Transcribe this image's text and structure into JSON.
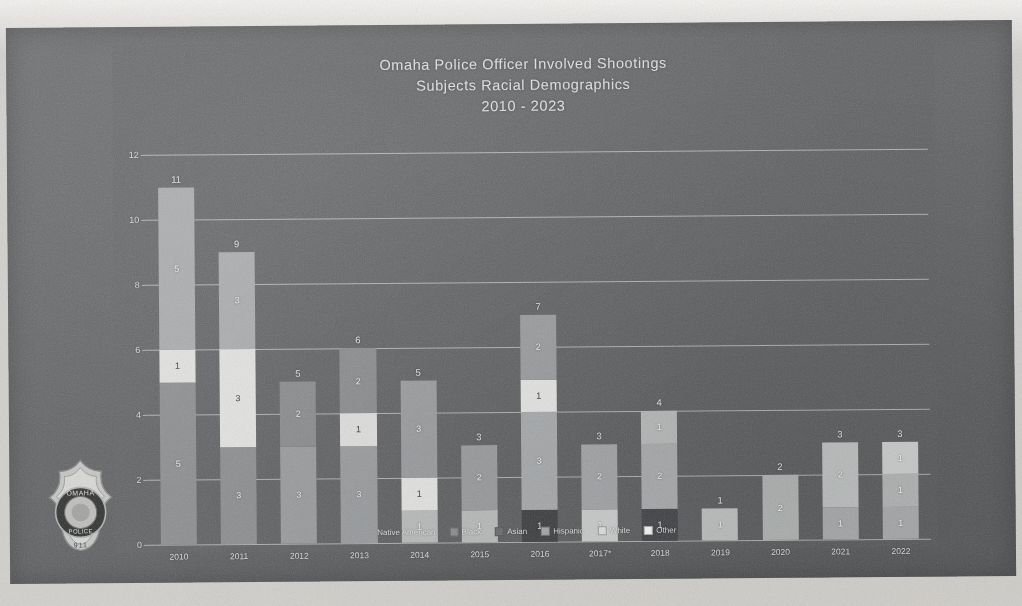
{
  "slide": {
    "title_lines": [
      "Omaha Police Officer Involved Shootings",
      "Subjects Racial Demographics",
      "2010 - 2023"
    ],
    "badge_alt": "omaha-police-badge"
  },
  "legend": {
    "position": "bottom-center",
    "entries": [
      {
        "label": "Native American",
        "color": "#3c3e40"
      },
      {
        "label": "Black",
        "color": "#8d8f91"
      },
      {
        "label": "Asian",
        "color": "#6d7073"
      },
      {
        "label": "Hispanic",
        "color": "#a7a9ab"
      },
      {
        "label": "White",
        "color": "#dcdddd"
      },
      {
        "label": "Other",
        "color": "#f2f2f0"
      }
    ]
  },
  "chart_data": {
    "type": "bar",
    "stacked": true,
    "title": "Omaha Police Officer Involved Shootings Subjects Racial Demographics 2010 - 2023",
    "xlabel": "",
    "ylabel": "",
    "ylim": [
      0,
      12
    ],
    "yticks": [
      0,
      2,
      4,
      6,
      8,
      10,
      12
    ],
    "grid": true,
    "categories": [
      "2010",
      "2011",
      "2012",
      "2013",
      "2014",
      "2015",
      "2016",
      "2017*",
      "2018",
      "2019",
      "2020",
      "2021",
      "2022"
    ],
    "series": [
      {
        "name": "Native American",
        "color": "#3c3e40",
        "values": [
          0,
          0,
          0,
          0,
          0,
          0,
          1,
          0,
          1,
          0,
          0,
          0,
          0
        ]
      },
      {
        "name": "Black",
        "color": "#8d8f91",
        "values": [
          5,
          3,
          3,
          3,
          1,
          1,
          3,
          0,
          0,
          0,
          0,
          1,
          1
        ]
      },
      {
        "name": "Asian",
        "color": "#6d7073",
        "values": [
          0,
          0,
          0,
          0,
          0,
          0,
          0,
          0,
          0,
          0,
          0,
          0,
          0
        ]
      },
      {
        "name": "Hispanic",
        "color": "#a7a9ab",
        "values": [
          5,
          3,
          2,
          2,
          3,
          2,
          2,
          2,
          2,
          1,
          2,
          2,
          1
        ]
      },
      {
        "name": "White",
        "color": "#dcdddd",
        "values": [
          1,
          3,
          0,
          1,
          1,
          0,
          1,
          1,
          1,
          0,
          0,
          0,
          1
        ]
      },
      {
        "name": "Other",
        "color": "#f2f2f0",
        "values": [
          0,
          0,
          0,
          0,
          0,
          0,
          0,
          0,
          0,
          0,
          0,
          0,
          0
        ]
      }
    ],
    "totals": [
      11,
      9,
      5,
      6,
      5,
      3,
      7,
      3,
      4,
      1,
      2,
      3,
      3
    ],
    "bars": [
      {
        "category": "2010",
        "total": 11,
        "segments": [
          {
            "series": "Black",
            "value": 5,
            "label": "5",
            "color": "#8d8f91",
            "dark_text": false
          },
          {
            "series": "White",
            "value": 1,
            "label": "1",
            "color": "#e2e3e1",
            "dark_text": true
          },
          {
            "series": "Hispanic",
            "value": 5,
            "label": "5",
            "color": "#a9abad",
            "dark_text": false
          }
        ]
      },
      {
        "category": "2011",
        "total": 9,
        "segments": [
          {
            "series": "Black",
            "value": 3,
            "label": "3",
            "color": "#8d8f91",
            "dark_text": false
          },
          {
            "series": "White",
            "value": 3,
            "label": "3",
            "color": "#e2e3e1",
            "dark_text": true
          },
          {
            "series": "Hispanic",
            "value": 3,
            "label": "3",
            "color": "#a9abad",
            "dark_text": false
          }
        ]
      },
      {
        "category": "2012",
        "total": 5,
        "segments": [
          {
            "series": "Black",
            "value": 3,
            "label": "3",
            "color": "#9a9c9e",
            "dark_text": false
          },
          {
            "series": "Hispanic",
            "value": 2,
            "label": "2",
            "color": "#8a8c8e",
            "dark_text": false
          }
        ]
      },
      {
        "category": "2013",
        "total": 6,
        "segments": [
          {
            "series": "Black",
            "value": 3,
            "label": "3",
            "color": "#9a9c9e",
            "dark_text": false
          },
          {
            "series": "White",
            "value": 1,
            "label": "1",
            "color": "#dddedc",
            "dark_text": true
          },
          {
            "series": "Hispanic",
            "value": 2,
            "label": "2",
            "color": "#8a8c8e",
            "dark_text": false
          }
        ]
      },
      {
        "category": "2014",
        "total": 5,
        "segments": [
          {
            "series": "Black",
            "value": 1,
            "label": "1",
            "color": "#b9bbbb",
            "dark_text": false
          },
          {
            "series": "White",
            "value": 1,
            "label": "1",
            "color": "#e2e3e1",
            "dark_text": true
          },
          {
            "series": "Hispanic",
            "value": 3,
            "label": "3",
            "color": "#9a9c9e",
            "dark_text": false
          }
        ]
      },
      {
        "category": "2015",
        "total": 3,
        "segments": [
          {
            "series": "Black",
            "value": 1,
            "label": "1",
            "color": "#b9bbbb",
            "dark_text": false
          },
          {
            "series": "Hispanic",
            "value": 2,
            "label": "2",
            "color": "#9a9c9e",
            "dark_text": false
          }
        ]
      },
      {
        "category": "2016",
        "total": 7,
        "segments": [
          {
            "series": "Native American",
            "value": 1,
            "label": "1",
            "color": "#3f4143",
            "dark_text": false
          },
          {
            "series": "Black",
            "value": 3,
            "label": "3",
            "color": "#a8aaac",
            "dark_text": false
          },
          {
            "series": "White",
            "value": 1,
            "label": "1",
            "color": "#e2e3e1",
            "dark_text": true
          },
          {
            "series": "Hispanic",
            "value": 2,
            "label": "2",
            "color": "#9a9c9e",
            "dark_text": false
          }
        ]
      },
      {
        "category": "2017*",
        "total": 3,
        "segments": [
          {
            "series": "White",
            "value": 1,
            "label": "1",
            "color": "#c9cbcb",
            "dark_text": false
          },
          {
            "series": "Hispanic",
            "value": 2,
            "label": "2",
            "color": "#a3a5a7",
            "dark_text": false
          }
        ]
      },
      {
        "category": "2018",
        "total": 4,
        "segments": [
          {
            "series": "Native American",
            "value": 1,
            "label": "1",
            "color": "#44464a",
            "dark_text": false
          },
          {
            "series": "Hispanic",
            "value": 2,
            "label": "2",
            "color": "#a9abad",
            "dark_text": false
          },
          {
            "series": "White",
            "value": 1,
            "label": "1",
            "color": "#b6b8b8",
            "dark_text": false
          }
        ]
      },
      {
        "category": "2019",
        "total": 1,
        "segments": [
          {
            "series": "Hispanic",
            "value": 1,
            "label": "1",
            "color": "#bcbebe",
            "dark_text": false
          }
        ]
      },
      {
        "category": "2020",
        "total": 2,
        "segments": [
          {
            "series": "Hispanic",
            "value": 2,
            "label": "2",
            "color": "#b0b2b2",
            "dark_text": false
          }
        ]
      },
      {
        "category": "2021",
        "total": 3,
        "segments": [
          {
            "series": "Black",
            "value": 1,
            "label": "1",
            "color": "#a8aaac",
            "dark_text": false
          },
          {
            "series": "Hispanic",
            "value": 2,
            "label": "2",
            "color": "#bcbebe",
            "dark_text": false
          }
        ]
      },
      {
        "category": "2022",
        "total": 3,
        "segments": [
          {
            "series": "Black",
            "value": 1,
            "label": "1",
            "color": "#a8aaac",
            "dark_text": false
          },
          {
            "series": "Hispanic",
            "value": 1,
            "label": "1",
            "color": "#b2b4b4",
            "dark_text": false
          },
          {
            "series": "White",
            "value": 1,
            "label": "1",
            "color": "#c9cbcb",
            "dark_text": false
          }
        ]
      }
    ]
  }
}
